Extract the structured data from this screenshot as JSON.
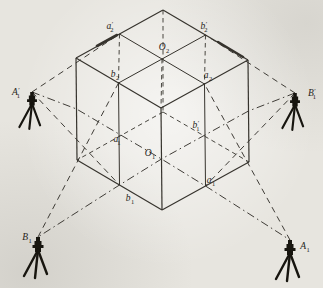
{
  "figure": {
    "width": 323,
    "height": 288,
    "background_color": "#e7e5df",
    "line_color": "#36332d",
    "tripod_color": "#17150f",
    "label_color": "#262420"
  },
  "cube": {
    "vertices": {
      "apex": [
        163,
        10
      ],
      "left_top": [
        76,
        58
      ],
      "right_top": [
        248,
        60
      ],
      "front_top": [
        161,
        108
      ],
      "left_bottom": [
        77,
        160
      ],
      "right_bottom": [
        249,
        162
      ],
      "front_bottom": [
        162,
        210
      ],
      "hidden_back_bottom": [
        163,
        112
      ]
    },
    "points": {
      "a2p": [
        119.5,
        34
      ],
      "b2p": [
        205.5,
        35
      ],
      "O2": [
        162,
        59
      ],
      "b2": [
        118.5,
        83
      ],
      "a2": [
        204.5,
        84
      ],
      "ml": [
        76.5,
        109
      ],
      "mr": [
        248.5,
        111
      ],
      "O1": [
        161.5,
        159
      ],
      "a1p": [
        119,
        134
      ],
      "b1p": [
        205,
        135
      ],
      "b1": [
        119.5,
        185
      ],
      "a1": [
        205.5,
        186
      ]
    },
    "solid_edges": [
      [
        "apex",
        "left_top"
      ],
      [
        "apex",
        "right_top"
      ],
      [
        "left_top",
        "front_top"
      ],
      [
        "right_top",
        "front_top"
      ],
      [
        "left_top",
        "left_bottom"
      ],
      [
        "right_top",
        "right_bottom"
      ],
      [
        "front_top",
        "front_bottom"
      ],
      [
        "left_bottom",
        "front_bottom"
      ],
      [
        "right_bottom",
        "front_bottom"
      ]
    ],
    "grid_lines": [
      [
        "a2p",
        "a2"
      ],
      [
        "b2p",
        "b2"
      ],
      [
        "b2",
        "b1"
      ],
      [
        "a2",
        "a1"
      ]
    ],
    "hidden_edges": [
      [
        "apex",
        "hidden_back_bottom"
      ],
      [
        "hidden_back_bottom",
        "left_bottom"
      ],
      [
        "hidden_back_bottom",
        "right_bottom"
      ]
    ],
    "plumb_lines": [
      [
        "a2p",
        "b2"
      ],
      [
        "b2p",
        "a2"
      ],
      [
        "O2",
        "front_top"
      ]
    ],
    "thick_overlaps": [
      [
        [
          97,
          46
        ],
        [
          117,
          35
        ]
      ],
      [
        [
          218,
          42
        ],
        [
          243,
          57
        ]
      ]
    ]
  },
  "axes": [
    {
      "id": "axis-A",
      "points": [
        [
          32,
          92
        ],
        [
          76.5,
          109
        ],
        [
          161.5,
          159
        ],
        [
          205.5,
          186
        ],
        [
          290,
          240
        ]
      ]
    },
    {
      "id": "axis-B",
      "points": [
        [
          295,
          93
        ],
        [
          248.5,
          111
        ],
        [
          161.5,
          159
        ],
        [
          119.5,
          185
        ],
        [
          38,
          237
        ]
      ]
    }
  ],
  "sight_rays": [
    {
      "id": "ray-A1p-a2p",
      "from": [
        32,
        92
      ],
      "to": [
        119.5,
        34
      ]
    },
    {
      "id": "ray-B1p-b2p",
      "from": [
        295,
        93
      ],
      "to": [
        205.5,
        35
      ]
    },
    {
      "id": "ray-A1p-b1",
      "from": [
        32,
        92
      ],
      "to": [
        119.5,
        185
      ]
    },
    {
      "id": "ray-B1p-a1",
      "from": [
        295,
        93
      ],
      "to": [
        205.5,
        186
      ]
    },
    {
      "id": "ray-B1-b2",
      "from": [
        38,
        237
      ],
      "to": [
        118.5,
        83
      ]
    },
    {
      "id": "ray-A1-a2",
      "from": [
        290,
        240
      ],
      "to": [
        204.5,
        84
      ]
    }
  ],
  "stations": [
    {
      "id": "A1p",
      "x": 32,
      "y": 92,
      "scale": 0.9,
      "label": {
        "base": "A",
        "prime": true,
        "sub": "1"
      },
      "label_x": 16,
      "label_y": 95
    },
    {
      "id": "B1p",
      "x": 295,
      "y": 93,
      "scale": 0.9,
      "label": {
        "base": "B",
        "prime": true,
        "sub": "1"
      },
      "label_x": 312,
      "label_y": 96
    },
    {
      "id": "B1",
      "x": 38,
      "y": 237,
      "scale": 1.0,
      "label": {
        "base": "B",
        "prime": false,
        "sub": "1"
      },
      "label_x": 27,
      "label_y": 240
    },
    {
      "id": "A1",
      "x": 290,
      "y": 240,
      "scale": 1.0,
      "label": {
        "base": "A",
        "prime": false,
        "sub": "1"
      },
      "label_x": 305,
      "label_y": 249
    }
  ],
  "point_labels": [
    {
      "id": "a2p",
      "base": "a",
      "prime": true,
      "sub": "2",
      "x": 110,
      "y": 29
    },
    {
      "id": "b2p",
      "base": "b",
      "prime": true,
      "sub": "2",
      "x": 204,
      "y": 29
    },
    {
      "id": "O2",
      "base": "O",
      "prime": false,
      "sub": "2",
      "x": 164,
      "y": 50
    },
    {
      "id": "b2",
      "base": "b",
      "prime": false,
      "sub": "2",
      "x": 115,
      "y": 77
    },
    {
      "id": "a2",
      "base": "a",
      "prime": false,
      "sub": "2",
      "x": 208,
      "y": 78
    },
    {
      "id": "a1p",
      "base": "a",
      "prime": true,
      "sub": "1",
      "x": 117,
      "y": 142
    },
    {
      "id": "b1p",
      "base": "b",
      "prime": true,
      "sub": "1",
      "x": 196,
      "y": 128
    },
    {
      "id": "O1",
      "base": "O",
      "prime": false,
      "sub": "1",
      "x": 150,
      "y": 156
    },
    {
      "id": "b1",
      "base": "b",
      "prime": false,
      "sub": "1",
      "x": 130,
      "y": 201
    },
    {
      "id": "a1",
      "base": "a",
      "prime": false,
      "sub": "1",
      "x": 211,
      "y": 183
    }
  ]
}
